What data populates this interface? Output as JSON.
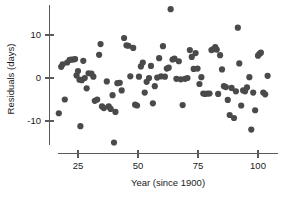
{
  "chart_data": {
    "type": "scatter",
    "title": "",
    "xlabel": "Year (since 1900)",
    "ylabel": "Residuals (days)",
    "xlim": [
      15,
      107
    ],
    "ylim": [
      -16,
      17
    ],
    "xticks": [
      25,
      50,
      75,
      100
    ],
    "xticklabels": [
      "25",
      "50",
      "75",
      "100"
    ],
    "yticks": [
      10,
      0,
      -10
    ],
    "yticklabels": [
      "10",
      "0",
      "-10"
    ],
    "grid": false,
    "legend": null,
    "marker": {
      "shape": "circle",
      "color": "#4a4a4a",
      "size": 3.1
    },
    "points": [
      [
        17.0,
        -8.2
      ],
      [
        18.0,
        2.6
      ],
      [
        18.6,
        3.2
      ],
      [
        19.5,
        -5.0
      ],
      [
        20.5,
        3.6
      ],
      [
        21.5,
        4.2
      ],
      [
        22.3,
        4.3
      ],
      [
        23.0,
        4.3
      ],
      [
        23.8,
        4.4
      ],
      [
        24.4,
        0.6
      ],
      [
        25.0,
        1.6
      ],
      [
        25.6,
        -0.4
      ],
      [
        26.0,
        -11.2
      ],
      [
        26.6,
        -0.5
      ],
      [
        27.2,
        4.0
      ],
      [
        27.8,
        0.0
      ],
      [
        28.6,
        -2.4
      ],
      [
        29.4,
        1.1
      ],
      [
        30.6,
        1.0
      ],
      [
        31.4,
        0.3
      ],
      [
        32.0,
        -5.3
      ],
      [
        33.0,
        -5.0
      ],
      [
        33.8,
        5.4
      ],
      [
        34.4,
        7.9
      ],
      [
        35.0,
        -6.6
      ],
      [
        35.8,
        -7.0
      ],
      [
        37.0,
        -0.8
      ],
      [
        37.8,
        -6.6
      ],
      [
        38.6,
        -7.2
      ],
      [
        39.4,
        -4.0
      ],
      [
        40.0,
        -15.0
      ],
      [
        40.6,
        -7.9
      ],
      [
        41.4,
        -1.2
      ],
      [
        42.4,
        -1.1
      ],
      [
        43.2,
        -2.9
      ],
      [
        44.2,
        9.3
      ],
      [
        45.2,
        7.6
      ],
      [
        46.0,
        7.5
      ],
      [
        46.8,
        0.4
      ],
      [
        48.0,
        7.0
      ],
      [
        48.8,
        -6.2
      ],
      [
        49.6,
        -6.4
      ],
      [
        50.4,
        0.3
      ],
      [
        51.2,
        2.7
      ],
      [
        52.0,
        3.6
      ],
      [
        52.8,
        -3.4
      ],
      [
        53.6,
        -0.9
      ],
      [
        54.6,
        0.0
      ],
      [
        55.4,
        2.8
      ],
      [
        56.2,
        -5.9
      ],
      [
        57.0,
        -1.9
      ],
      [
        58.0,
        0.1
      ],
      [
        58.8,
        4.6
      ],
      [
        59.6,
        0.4
      ],
      [
        60.4,
        7.4
      ],
      [
        61.2,
        0.3
      ],
      [
        62.0,
        2.2
      ],
      [
        62.8,
        2.4
      ],
      [
        63.6,
        16.0
      ],
      [
        64.4,
        4.3
      ],
      [
        65.2,
        4.5
      ],
      [
        66.0,
        -0.2
      ],
      [
        67.0,
        3.9
      ],
      [
        67.8,
        -0.3
      ],
      [
        68.6,
        -6.3
      ],
      [
        69.6,
        -0.2
      ],
      [
        70.6,
        0.0
      ],
      [
        71.6,
        6.5
      ],
      [
        72.4,
        4.9
      ],
      [
        73.2,
        2.1
      ],
      [
        74.0,
        5.8
      ],
      [
        74.8,
        2.2
      ],
      [
        75.6,
        -1.4
      ],
      [
        76.4,
        0.2
      ],
      [
        77.2,
        -3.6
      ],
      [
        78.0,
        -3.7
      ],
      [
        79.0,
        -3.6
      ],
      [
        79.8,
        -3.6
      ],
      [
        80.6,
        6.5
      ],
      [
        81.4,
        6.7
      ],
      [
        82.2,
        7.2
      ],
      [
        82.8,
        6.6
      ],
      [
        83.4,
        -3.7
      ],
      [
        84.2,
        5.3
      ],
      [
        85.0,
        2.0
      ],
      [
        85.8,
        -1.9
      ],
      [
        86.6,
        -2.1
      ],
      [
        87.4,
        -5.1
      ],
      [
        88.2,
        -8.6
      ],
      [
        89.0,
        -2.3
      ],
      [
        90.0,
        -9.3
      ],
      [
        90.8,
        -3.1
      ],
      [
        91.6,
        11.7
      ],
      [
        92.2,
        3.4
      ],
      [
        93.0,
        -6.4
      ],
      [
        93.8,
        -2.9
      ],
      [
        94.6,
        -3.1
      ],
      [
        95.4,
        -2.2
      ],
      [
        96.4,
        0.2
      ],
      [
        97.2,
        -12.0
      ],
      [
        98.0,
        -3.4
      ],
      [
        98.8,
        -7.5
      ],
      [
        100.0,
        5.2
      ],
      [
        100.6,
        5.6
      ],
      [
        101.2,
        5.9
      ],
      [
        102.2,
        -3.4
      ],
      [
        103.0,
        -3.8
      ],
      [
        104.0,
        0.5
      ]
    ]
  }
}
